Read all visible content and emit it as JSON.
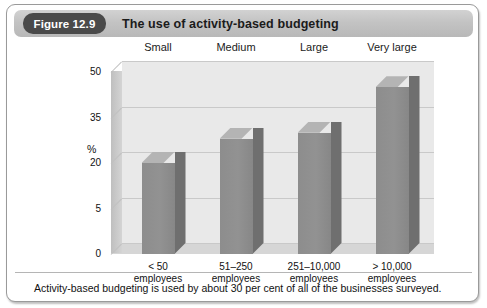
{
  "figure": {
    "badge_label": "Figure 12.9",
    "title": "The use of activity-based budgeting"
  },
  "caption": {
    "text": "Activity-based budgeting is used by about 30 per cent of all of the businesses surveyed."
  },
  "axis": {
    "y_unit": "%"
  },
  "chart_data": {
    "type": "bar",
    "title": "The use of activity-based budgeting",
    "xlabel": "",
    "ylabel": "%",
    "categories": [
      "< 50\nemployees",
      "51–250\nemployees",
      "251–10,000\nemployees",
      "> 10,000\nemployees"
    ],
    "category_lines": [
      [
        "< 50",
        "employees"
      ],
      [
        "51–250",
        "employees"
      ],
      [
        "251–10,000",
        "employees"
      ],
      [
        "> 10,000",
        "employees"
      ]
    ],
    "group_labels": [
      "Small",
      "Medium",
      "Large",
      "Very large"
    ],
    "values": [
      20,
      28,
      30,
      45
    ],
    "ytick_labels": [
      "0",
      "5",
      "20",
      "35",
      "50"
    ],
    "ytick_values": [
      0,
      5,
      20,
      35,
      50
    ],
    "ylim": [
      0,
      50
    ],
    "grid": true,
    "legend": "none",
    "style": "3d-column",
    "colors": {
      "bar_front": "#8d8d8d",
      "bar_side": "#6f6f6f",
      "bar_top": "#b4b4b4",
      "back_wall": "#e9e9e9",
      "floor": "#d6d6d6",
      "gridline": "#c9c9c9",
      "badge_bg": "#4a4a4a",
      "titlebar_bg": "#c3c3c3",
      "text": "#111111"
    }
  }
}
